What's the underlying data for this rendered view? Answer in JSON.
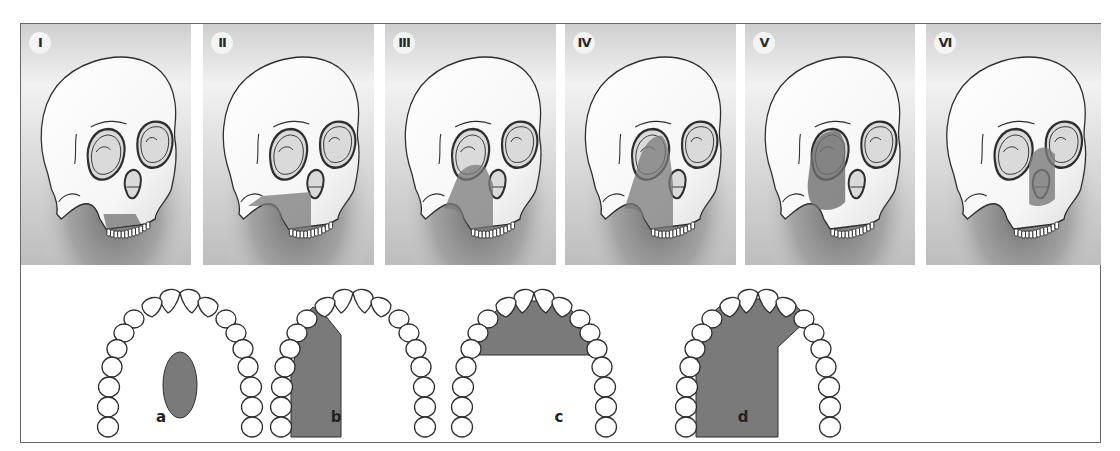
{
  "figure": {
    "skull_panels": [
      {
        "label": "I",
        "shaded_region": "mandible-center"
      },
      {
        "label": "II",
        "shaded_region": "maxilla-lower-left"
      },
      {
        "label": "III",
        "shaded_region": "maxilla-left-with-orbit-floor"
      },
      {
        "label": "IV",
        "shaded_region": "maxilla-left-with-orbit"
      },
      {
        "label": "V",
        "shaded_region": "orbit-and-zygoma-left"
      },
      {
        "label": "VI",
        "shaded_region": "nasal-central"
      }
    ],
    "palate_diagrams": [
      {
        "label": "a",
        "defect_shape": "central-oval"
      },
      {
        "label": "b",
        "defect_shape": "unilateral-lateral"
      },
      {
        "label": "c",
        "defect_shape": "anterior-transverse"
      },
      {
        "label": "d",
        "defect_shape": "extended-unilateral"
      }
    ]
  },
  "colors": {
    "defect_fill": "#7a7a7a",
    "outline": "#2e2e2e",
    "panel_bg_light": "#e6e6e6",
    "panel_bg_dark": "#8f8f8f",
    "frame": "#6a6a6a"
  }
}
